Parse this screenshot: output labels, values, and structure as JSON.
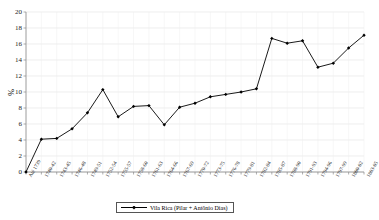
{
  "chart_data": {
    "type": "line",
    "title": "",
    "xlabel": "",
    "ylabel": "%",
    "ylim": [
      0,
      20
    ],
    "ytick_step": 2,
    "yticks": [
      20,
      18,
      16,
      14,
      12,
      10,
      8,
      6,
      4,
      2,
      0
    ],
    "grid": true,
    "legend_position": "bottom-center",
    "legend": [
      "Vila Rica (Pilar + Antônio Dias)"
    ],
    "marker": "diamond",
    "line_color": "#000000",
    "categories": [
      "Até 1739",
      "1740-42",
      "1743-45",
      "1746-48",
      "1749-51",
      "1752-54",
      "1755-57",
      "1758-60",
      "1761-63",
      "1764-66",
      "1767-69",
      "1770-72",
      "1773-75",
      "1776-78",
      "1779-81",
      "1782-84",
      "1785-87",
      "1788-90",
      "1791-93",
      "1794-96",
      "1797-99",
      "1800-02",
      "1803-05"
    ],
    "series": [
      {
        "name": "Vila Rica (Pilar + Antônio Dias)",
        "values": [
          0,
          4.1,
          4.2,
          5.4,
          7.4,
          10.3,
          6.9,
          8.2,
          8.3,
          5.9,
          8.1,
          8.6,
          9.4,
          9.7,
          10.0,
          10.4,
          16.7,
          16.1,
          16.4,
          13.1,
          13.6,
          15.5,
          17.1
        ]
      }
    ]
  }
}
